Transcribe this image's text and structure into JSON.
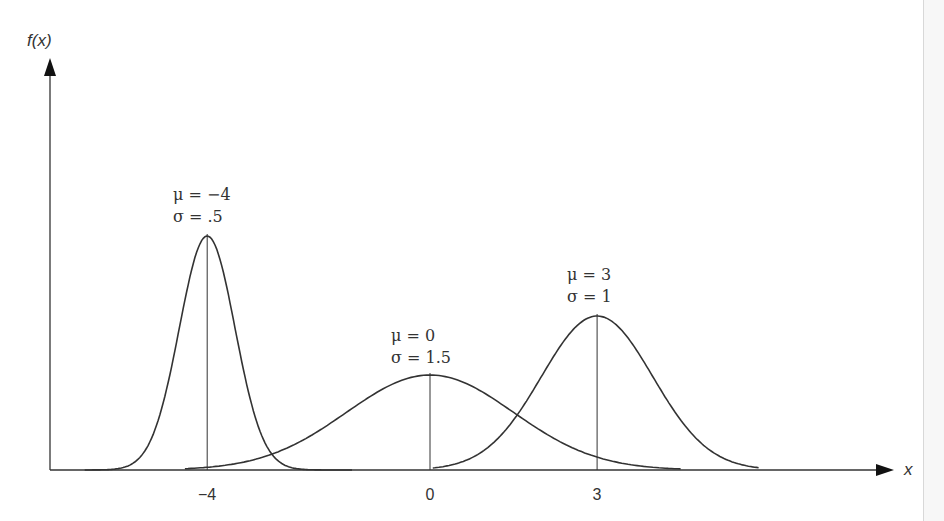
{
  "chart_data": {
    "type": "line",
    "title": "",
    "xlabel": "x",
    "ylabel": "f(x)",
    "x_ticks": [
      "−4",
      "0",
      "3"
    ],
    "x_tick_values": [
      -4,
      0,
      3
    ],
    "grid": false,
    "legend": "none",
    "series": [
      {
        "name": "μ = −4, σ = .5",
        "mu": -4,
        "sigma": 0.5,
        "mu_label": "μ = −4",
        "sigma_label": "σ = .5",
        "peak_px": 234,
        "range": [
          -6.2,
          -1.4
        ]
      },
      {
        "name": "μ = 0, σ = 1.5",
        "mu": 0,
        "sigma": 1.5,
        "mu_label": "μ = 0",
        "sigma_label": "σ = 1.5",
        "peak_px": 95,
        "range": [
          -4.4,
          4.5
        ]
      },
      {
        "name": "μ = 3, σ = 1",
        "mu": 3,
        "sigma": 1,
        "mu_label": "μ = 3",
        "sigma_label": "σ = 1",
        "peak_px": 154,
        "range": [
          0.05,
          5.9
        ]
      }
    ]
  },
  "axes": {
    "y_label": "f(x)",
    "x_label": "x"
  }
}
